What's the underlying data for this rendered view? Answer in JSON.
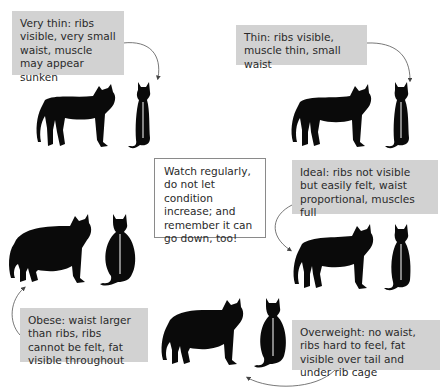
{
  "diagram": {
    "colors": {
      "label_bg": "#d2d2d2",
      "silhouette": "#0a0a0a",
      "arrow": "#555555",
      "text": "#2a2a2a"
    },
    "stages": [
      {
        "id": "very-thin",
        "label": "Very thin: ribs visible, very small waist, muscle may appear sunken"
      },
      {
        "id": "thin",
        "label": "Thin: ribs visible, muscle thin, small waist"
      },
      {
        "id": "ideal",
        "label": "Ideal: ribs not visible but easily felt, waist proportional, muscles full"
      },
      {
        "id": "overweight",
        "label": "Overweight: no waist, ribs hard to feel, fat visible over tail and under rib cage"
      },
      {
        "id": "obese",
        "label": "Obese: waist larger than ribs, ribs cannot be felt, fat visible throughout"
      }
    ],
    "center_note": "Watch regularly, do not let condition increase; and remember it can go down, too!"
  }
}
